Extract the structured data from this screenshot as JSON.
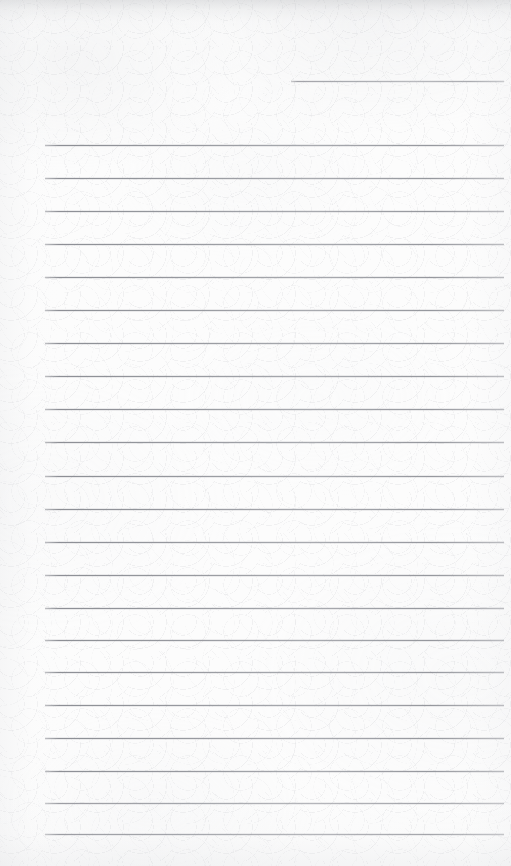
{
  "page": {
    "kind": "scanned-lined-notebook-page",
    "width_px": 511,
    "height_px": 866,
    "text_content": "",
    "colors": {
      "paper": "#fcfcfc",
      "rule_line": "#7c7f86",
      "rule_line_light": "#9a9ca2",
      "edge_shadow": "#aaacb0"
    },
    "margins": {
      "left_x": 45,
      "right_x": 504,
      "first_partial_line_start_x": 291
    },
    "ruling": {
      "line_count": 22,
      "spacing_px": 33,
      "stroke_px": 1,
      "style": "wide-ruled horizontal",
      "has_vertical_margin_rule": false,
      "has_holes": false
    },
    "lines": [
      {
        "index": 1,
        "y": 81,
        "x_start": 291,
        "x_end": 504,
        "partial": true
      },
      {
        "index": 2,
        "y": 145,
        "x_start": 45,
        "x_end": 504,
        "partial": false
      },
      {
        "index": 3,
        "y": 178,
        "x_start": 45,
        "x_end": 504,
        "partial": false
      },
      {
        "index": 4,
        "y": 211,
        "x_start": 45,
        "x_end": 504,
        "partial": false
      },
      {
        "index": 5,
        "y": 244,
        "x_start": 45,
        "x_end": 504,
        "partial": false
      },
      {
        "index": 6,
        "y": 277,
        "x_start": 45,
        "x_end": 504,
        "partial": false
      },
      {
        "index": 7,
        "y": 310,
        "x_start": 45,
        "x_end": 504,
        "partial": false
      },
      {
        "index": 8,
        "y": 343,
        "x_start": 45,
        "x_end": 504,
        "partial": false
      },
      {
        "index": 9,
        "y": 376,
        "x_start": 45,
        "x_end": 504,
        "partial": false
      },
      {
        "index": 10,
        "y": 409,
        "x_start": 45,
        "x_end": 504,
        "partial": false
      },
      {
        "index": 11,
        "y": 442,
        "x_start": 45,
        "x_end": 504,
        "partial": false
      },
      {
        "index": 12,
        "y": 476,
        "x_start": 45,
        "x_end": 504,
        "partial": false
      },
      {
        "index": 13,
        "y": 509,
        "x_start": 45,
        "x_end": 504,
        "partial": false
      },
      {
        "index": 14,
        "y": 542,
        "x_start": 45,
        "x_end": 504,
        "partial": false
      },
      {
        "index": 15,
        "y": 575,
        "x_start": 45,
        "x_end": 504,
        "partial": false
      },
      {
        "index": 16,
        "y": 608,
        "x_start": 45,
        "x_end": 504,
        "partial": false
      },
      {
        "index": 17,
        "y": 640,
        "x_start": 45,
        "x_end": 504,
        "partial": false
      },
      {
        "index": 18,
        "y": 672,
        "x_start": 45,
        "x_end": 504,
        "partial": false
      },
      {
        "index": 19,
        "y": 705,
        "x_start": 45,
        "x_end": 504,
        "partial": false
      },
      {
        "index": 20,
        "y": 738,
        "x_start": 45,
        "x_end": 504,
        "partial": false
      },
      {
        "index": 21,
        "y": 771,
        "x_start": 45,
        "x_end": 504,
        "partial": false
      },
      {
        "index": 22,
        "y": 803,
        "x_start": 45,
        "x_end": 504,
        "partial": false
      },
      {
        "index": 23,
        "y": 834,
        "x_start": 45,
        "x_end": 504,
        "partial": false
      }
    ]
  }
}
